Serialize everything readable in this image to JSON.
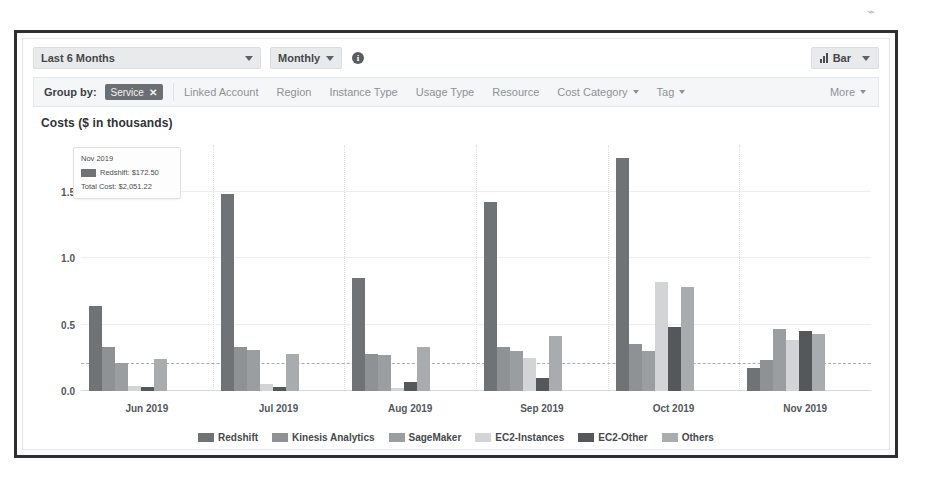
{
  "page": {
    "artifact": "⌁"
  },
  "toolbar": {
    "date_range": "Last 6 Months",
    "granularity": "Monthly",
    "info_icon": "i",
    "chart_type": "Bar",
    "chart_type_icon": "bar-chart-icon"
  },
  "groupby": {
    "label": "Group by:",
    "chip": {
      "label": "Service",
      "remove": "✕"
    },
    "items": [
      {
        "label": "Linked Account",
        "has_caret": false
      },
      {
        "label": "Region",
        "has_caret": false
      },
      {
        "label": "Instance Type",
        "has_caret": false
      },
      {
        "label": "Usage Type",
        "has_caret": false
      },
      {
        "label": "Resource",
        "has_caret": false
      },
      {
        "label": "Cost Category",
        "has_caret": true
      },
      {
        "label": "Tag",
        "has_caret": true
      }
    ],
    "more": "More"
  },
  "tooltip": {
    "title": "Nov 2019",
    "series_label": "Redshift: $172.50",
    "total_label": "Total Cost: $2,051.22"
  },
  "chart_data": {
    "type": "bar",
    "title": "Costs ($ in thousands)",
    "xlabel": "",
    "ylabel": "Costs ($ in thousands)",
    "ylim": [
      0,
      1.85
    ],
    "yticks": [
      0.0,
      0.5,
      1.0,
      1.5
    ],
    "ytick_labels": [
      "0.0",
      "0.5",
      "1.0",
      "1.5"
    ],
    "grid": true,
    "legend_position": "bottom",
    "average_line": 0.2,
    "categories": [
      "Jun 2019",
      "Jul 2019",
      "Aug 2019",
      "Sep 2019",
      "Oct 2019",
      "Nov 2019"
    ],
    "series": [
      {
        "name": "Redshift",
        "color": "#6f7376",
        "values": [
          0.64,
          1.48,
          0.85,
          1.42,
          1.75,
          0.17
        ]
      },
      {
        "name": "Kinesis Analytics",
        "color": "#8f9295",
        "values": [
          0.33,
          0.33,
          0.28,
          0.33,
          0.35,
          0.23
        ]
      },
      {
        "name": "SageMaker",
        "color": "#9b9ea1",
        "values": [
          0.21,
          0.31,
          0.27,
          0.3,
          0.3,
          0.47
        ]
      },
      {
        "name": "EC2-Instances",
        "color": "#d2d4d6",
        "values": [
          0.04,
          0.05,
          0.02,
          0.25,
          0.82,
          0.38
        ]
      },
      {
        "name": "EC2-Other",
        "color": "#55585b",
        "values": [
          0.03,
          0.03,
          0.07,
          0.1,
          0.48,
          0.45
        ]
      },
      {
        "name": "Others",
        "color": "#a9acaf",
        "values": [
          0.24,
          0.28,
          0.33,
          0.41,
          0.78,
          0.43
        ]
      }
    ]
  }
}
